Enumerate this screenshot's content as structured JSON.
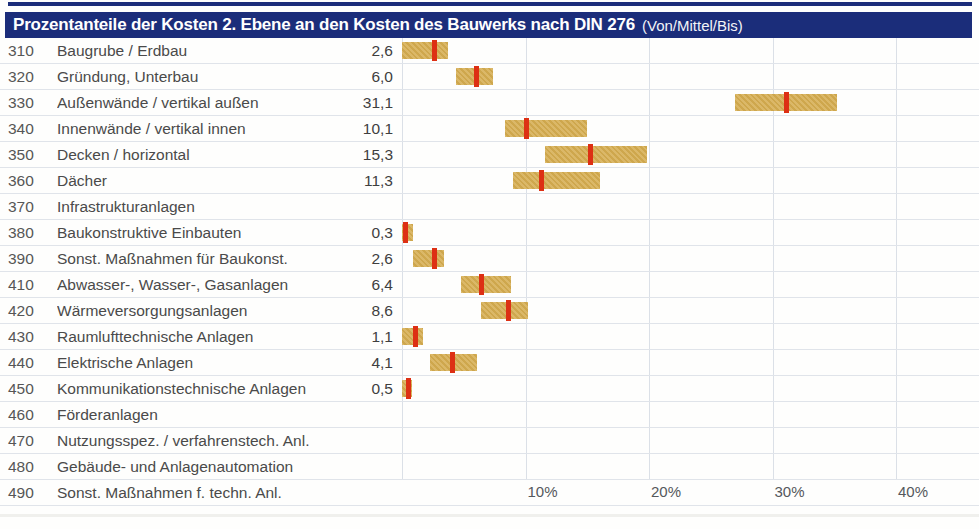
{
  "header": {
    "title": "Prozentanteile der Kosten 2. Ebene an den Kosten des Bauwerks nach DIN 276",
    "suffix": "(Von/Mittel/Bis)"
  },
  "colors": {
    "header_bg": "#1b2d7a",
    "header_text": "#ffffff",
    "bar_fill": "#d5ac4f",
    "mean_marker_red": "#dd3014",
    "gridline": "#dbe0e7",
    "row_separator": "#e0e4ea",
    "body_text": "#4a4a4a"
  },
  "chart_data": {
    "type": "range-bar",
    "title": "Prozentanteile der Kosten 2. Ebene an den Kosten des Bauwerks nach DIN 276",
    "legend_note": "Von/Mittel/Bis",
    "unit": "%",
    "orientation": "horizontal",
    "x_axis": {
      "min": 0,
      "max": 46,
      "tick_values": [
        10,
        20,
        30,
        40
      ],
      "tick_labels": [
        "10%",
        "20%",
        "30%",
        "40%"
      ],
      "grid": true
    },
    "rows": [
      {
        "code": "310",
        "label": "Baugrube / Erdbau",
        "mittel_label": "2,6",
        "von": 0.0,
        "mittel": 2.6,
        "bis": 3.7
      },
      {
        "code": "320",
        "label": "Gründung, Unterbau",
        "mittel_label": "6,0",
        "von": 4.4,
        "mittel": 6.0,
        "bis": 7.4
      },
      {
        "code": "330",
        "label": "Außenwände / vertikal außen",
        "mittel_label": "31,1",
        "von": 27.0,
        "mittel": 31.1,
        "bis": 35.2
      },
      {
        "code": "340",
        "label": "Innenwände / vertikal innen",
        "mittel_label": "10,1",
        "von": 8.3,
        "mittel": 10.1,
        "bis": 15.0
      },
      {
        "code": "350",
        "label": "Decken / horizontal",
        "mittel_label": "15,3",
        "von": 11.6,
        "mittel": 15.3,
        "bis": 19.8
      },
      {
        "code": "360",
        "label": "Dächer",
        "mittel_label": "11,3",
        "von": 9.0,
        "mittel": 11.3,
        "bis": 16.0
      },
      {
        "code": "370",
        "label": "Infrastrukturanlagen",
        "mittel_label": "",
        "von": null,
        "mittel": null,
        "bis": null
      },
      {
        "code": "380",
        "label": "Baukonstruktive Einbauten",
        "mittel_label": "0,3",
        "von": 0.0,
        "mittel": 0.3,
        "bis": 0.9
      },
      {
        "code": "390",
        "label": "Sonst. Maßnahmen für Baukonst.",
        "mittel_label": "2,6",
        "von": 0.9,
        "mittel": 2.6,
        "bis": 3.4
      },
      {
        "code": "410",
        "label": "Abwasser-, Wasser-, Gasanlagen",
        "mittel_label": "6,4",
        "von": 4.8,
        "mittel": 6.4,
        "bis": 8.8
      },
      {
        "code": "420",
        "label": "Wärmeversorgungsanlagen",
        "mittel_label": "8,6",
        "von": 6.4,
        "mittel": 8.6,
        "bis": 10.2
      },
      {
        "code": "430",
        "label": "Raumlufttechnische Anlagen",
        "mittel_label": "1,1",
        "von": 0.0,
        "mittel": 1.1,
        "bis": 1.7
      },
      {
        "code": "440",
        "label": "Elektrische Anlagen",
        "mittel_label": "4,1",
        "von": 2.3,
        "mittel": 4.1,
        "bis": 6.1
      },
      {
        "code": "450",
        "label": "Kommunikationstechnische Anlagen",
        "mittel_label": "0,5",
        "von": 0.0,
        "mittel": 0.5,
        "bis": 0.8
      },
      {
        "code": "460",
        "label": "Förderanlagen",
        "mittel_label": "",
        "von": null,
        "mittel": null,
        "bis": null
      },
      {
        "code": "470",
        "label": "Nutzungsspez. / verfahrenstech. Anl.",
        "mittel_label": "",
        "von": null,
        "mittel": null,
        "bis": null
      },
      {
        "code": "480",
        "label": "Gebäude- und Anlagenautomation",
        "mittel_label": "",
        "von": null,
        "mittel": null,
        "bis": null
      },
      {
        "code": "490",
        "label": "Sonst. Maßnahmen f. techn. Anl.",
        "mittel_label": "",
        "von": null,
        "mittel": null,
        "bis": null
      }
    ]
  }
}
